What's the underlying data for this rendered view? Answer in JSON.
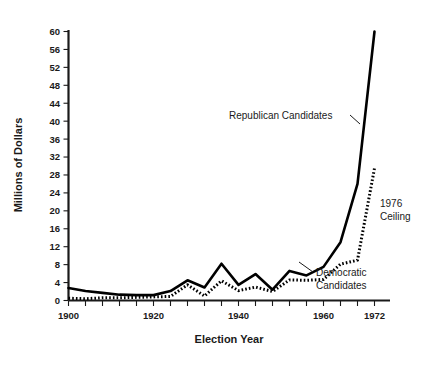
{
  "chart_data": {
    "type": "line",
    "title": "",
    "xlabel": "Election Year",
    "ylabel": "Millions of Dollars",
    "xlim": [
      1900,
      1974
    ],
    "ylim": [
      0,
      60
    ],
    "grid": false,
    "legend_position": "inline-annotations",
    "x_ticks": [
      1900,
      1920,
      1940,
      1960,
      1972
    ],
    "x_tick_labels": [
      "1900",
      "1920",
      "1940",
      "1960",
      "1972"
    ],
    "x_minor_tick_interval": 4,
    "y_ticks": [
      0,
      4,
      8,
      12,
      16,
      20,
      24,
      28,
      32,
      36,
      40,
      44,
      48,
      52,
      56,
      60
    ],
    "y_tick_labels": [
      "0",
      "4",
      "8",
      "12",
      "16",
      "20",
      "24",
      "28",
      "32",
      "36",
      "40",
      "44",
      "48",
      "52",
      "56",
      "60"
    ],
    "x": [
      1900,
      1904,
      1908,
      1912,
      1916,
      1920,
      1924,
      1928,
      1932,
      1936,
      1940,
      1944,
      1948,
      1952,
      1956,
      1960,
      1964,
      1968,
      1972
    ],
    "series": [
      {
        "name": "Republican Candidates",
        "style": "solid",
        "color": "#000000",
        "values": [
          2.8,
          2.1,
          1.7,
          1.3,
          1.2,
          1.2,
          2.1,
          4.5,
          2.9,
          8.2,
          3.5,
          5.9,
          2.4,
          6.6,
          5.6,
          7.5,
          13.0,
          26.0,
          60.0
        ]
      },
      {
        "name": "Democratic Candidates",
        "style": "dotted",
        "color": "#000000",
        "values": [
          0.5,
          0.4,
          0.6,
          0.6,
          0.7,
          0.8,
          0.9,
          3.5,
          1.0,
          4.4,
          2.2,
          3.0,
          2.0,
          4.6,
          4.5,
          4.7,
          8.1,
          9.0,
          29.5
        ]
      }
    ],
    "annotations": [
      {
        "name": "republican-label",
        "text": "Republican Candidates",
        "points_to_series": "Republican Candidates"
      },
      {
        "name": "democratic-label",
        "line1": "Democratic",
        "line2": "Candidates",
        "points_to_series": "Democratic Candidates"
      },
      {
        "name": "ceiling-label",
        "line1": "1976",
        "line2": "Ceiling",
        "points_to_series": "Democratic Candidates"
      }
    ]
  },
  "axes": {
    "y_title": "Millions of Dollars",
    "x_title": "Election Year"
  }
}
